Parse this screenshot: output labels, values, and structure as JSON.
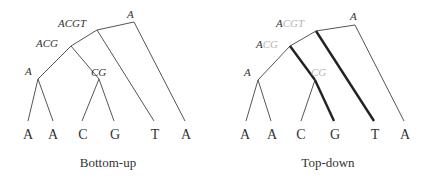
{
  "figure": {
    "panels": [
      {
        "id": "bottom-up",
        "caption": "Bottom-up",
        "leaves": [
          "A",
          "A",
          "C",
          "G",
          "T",
          "A"
        ],
        "internal_nodes": {
          "root": {
            "label": "A"
          },
          "acgt": {
            "label": "ACGT"
          },
          "acg": {
            "label": "ACG"
          },
          "a": {
            "label": "A"
          },
          "cg": {
            "label": "CG"
          }
        }
      },
      {
        "id": "top-down",
        "caption": "Top-down",
        "leaves": [
          "A",
          "A",
          "C",
          "G",
          "T",
          "A"
        ],
        "internal_nodes": {
          "root": {
            "label": "A"
          },
          "acgt": {
            "label_chosen": "A",
            "label_rest": "CGT"
          },
          "acg": {
            "label_chosen": "A",
            "label_rest": "CG"
          },
          "a": {
            "label": "A"
          },
          "cg": {
            "label_chosen": "",
            "label_rest": "CG"
          }
        },
        "highlighted_edges": [
          "acg-cg",
          "cg-G",
          "acgt-T"
        ]
      }
    ]
  }
}
